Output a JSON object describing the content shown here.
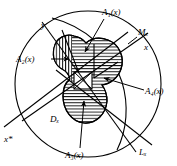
{
  "figure": {
    "background_color": "#ffffff",
    "stroke_color": "#000000",
    "labels": [
      {
        "id": "A1",
        "text_base": "A",
        "sub": "1",
        "suffix": "(x)",
        "x": 104,
        "y": 14
      },
      {
        "id": "Mx",
        "text_base": "M",
        "sub": "x",
        "suffix": "",
        "x": 139,
        "y": 34
      },
      {
        "id": "x",
        "text_base": "x",
        "sub": "",
        "suffix": "",
        "x": 145,
        "y": 49
      },
      {
        "id": "y",
        "text_base": "y",
        "sub": "",
        "suffix": "",
        "x": 44,
        "y": 27
      },
      {
        "id": "A2",
        "text_base": "A",
        "sub": "2",
        "suffix": "(x)",
        "x": 19,
        "y": 61
      },
      {
        "id": "A4",
        "text_base": "A",
        "sub": "4",
        "suffix": "(x)",
        "x": 146,
        "y": 92
      },
      {
        "id": "Dx",
        "text_base": "D",
        "sub": "x",
        "suffix": "",
        "x": 52,
        "y": 120
      },
      {
        "id": "A3",
        "text_base": "A",
        "sub": "3",
        "suffix": "(x)",
        "x": 68,
        "y": 155
      },
      {
        "id": "Lx",
        "text_base": "L",
        "sub": "x",
        "suffix": "",
        "x": 141,
        "y": 152
      },
      {
        "id": "xstar",
        "text_base": "x",
        "sub": "",
        "suffix": "*",
        "x": 6,
        "y": 140
      }
    ],
    "label_texts": {
      "A1": "A₁(x)",
      "Mx": "Mₓ",
      "x": "x",
      "y": "y",
      "A2": "A₂(x)",
      "A4": "A₄(x)",
      "Dx": "Dₓ",
      "A3": "A₃(x)",
      "Lx": "Lₓ",
      "xstar": "x*"
    },
    "elements": {
      "outer_circle": "outer-circle",
      "inner_arc": "inner-arc",
      "blob": "hatched-blob-region",
      "center_square": "center-square",
      "line_mx": "line-Mx",
      "line_lx": "line-Lx",
      "line_dx": "line-Dx",
      "line_y": "line-y"
    }
  }
}
